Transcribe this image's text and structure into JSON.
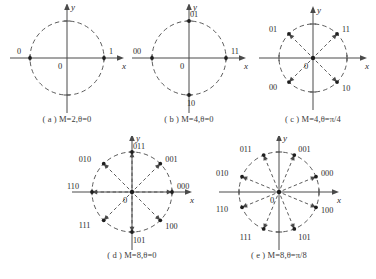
{
  "figure": {
    "background_color": "#ffffff",
    "ink_color": "#4a4a4a",
    "point_color": "#1e1e1e"
  },
  "axis": {
    "x_label": "x",
    "y_label": "y",
    "origin_label": "0"
  },
  "panels": [
    {
      "id": "a",
      "caption": "( a ) M=2,θ=0",
      "M": 2,
      "theta_label": "0",
      "theta_deg": 0,
      "radius": 37,
      "has_rays": false,
      "points": [
        {
          "label": "1",
          "angle_deg": 0,
          "label_dx": 5,
          "label_dy": -4
        },
        {
          "label": "0",
          "angle_deg": 180,
          "label_dx": -13,
          "label_dy": -4
        }
      ]
    },
    {
      "id": "b",
      "caption": "( b ) M=4,θ=0",
      "M": 4,
      "theta_label": "0",
      "theta_deg": 0,
      "radius": 37,
      "has_rays": false,
      "points": [
        {
          "label": "11",
          "angle_deg": 0,
          "label_dx": 5,
          "label_dy": -4
        },
        {
          "label": "01",
          "angle_deg": 90,
          "label_dx": 1,
          "label_dy": -4
        },
        {
          "label": "00",
          "angle_deg": 180,
          "label_dx": -19,
          "label_dy": -4
        },
        {
          "label": "10",
          "angle_deg": 270,
          "label_dx": -2,
          "label_dy": 11
        }
      ]
    },
    {
      "id": "c",
      "caption": "( c ) M=4,θ=π/4",
      "M": 4,
      "theta_label": "π/4",
      "theta_deg": 45,
      "radius": 34,
      "has_rays": true,
      "points": [
        {
          "label": "11",
          "angle_deg": 45,
          "label_dx": 5,
          "label_dy": -2
        },
        {
          "label": "01",
          "angle_deg": 135,
          "label_dx": -20,
          "label_dy": -2
        },
        {
          "label": "00",
          "angle_deg": 225,
          "label_dx": -20,
          "label_dy": 8
        },
        {
          "label": "10",
          "angle_deg": 315,
          "label_dx": 5,
          "label_dy": 9
        }
      ]
    },
    {
      "id": "d",
      "caption": "( d ) M=8,θ=0",
      "M": 8,
      "theta_label": "0",
      "theta_deg": 0,
      "radius": 40,
      "has_rays": true,
      "points": [
        {
          "label": "000",
          "angle_deg": 0,
          "label_dx": 5,
          "label_dy": -3
        },
        {
          "label": "001",
          "angle_deg": 45,
          "label_dx": 5,
          "label_dy": -2
        },
        {
          "label": "011",
          "angle_deg": 90,
          "label_dx": 1,
          "label_dy": -3
        },
        {
          "label": "010",
          "angle_deg": 135,
          "label_dx": -25,
          "label_dy": -2
        },
        {
          "label": "110",
          "angle_deg": 180,
          "label_dx": -25,
          "label_dy": -3
        },
        {
          "label": "111",
          "angle_deg": 225,
          "label_dx": -25,
          "label_dy": 8
        },
        {
          "label": "101",
          "angle_deg": 270,
          "label_dx": 1,
          "label_dy": 11
        },
        {
          "label": "100",
          "angle_deg": 315,
          "label_dx": 5,
          "label_dy": 9
        }
      ]
    },
    {
      "id": "e",
      "caption": "( e ) M=8,θ=π/8",
      "M": 8,
      "theta_label": "π/8",
      "theta_deg": 22.5,
      "radius": 40,
      "has_rays": true,
      "points": [
        {
          "label": "000",
          "angle_deg": 22.5,
          "label_dx": 5,
          "label_dy": -1
        },
        {
          "label": "001",
          "angle_deg": 67.5,
          "label_dx": 4,
          "label_dy": -3
        },
        {
          "label": "011",
          "angle_deg": 112.5,
          "label_dx": -24,
          "label_dy": -3
        },
        {
          "label": "010",
          "angle_deg": 157.5,
          "label_dx": -26,
          "label_dy": -1
        },
        {
          "label": "110",
          "angle_deg": 202.5,
          "label_dx": -26,
          "label_dy": 5
        },
        {
          "label": "111",
          "angle_deg": 247.5,
          "label_dx": -24,
          "label_dy": 11
        },
        {
          "label": "101",
          "angle_deg": 292.5,
          "label_dx": 4,
          "label_dy": 11
        },
        {
          "label": "100",
          "angle_deg": 337.5,
          "label_dx": 5,
          "label_dy": 6
        }
      ]
    }
  ]
}
